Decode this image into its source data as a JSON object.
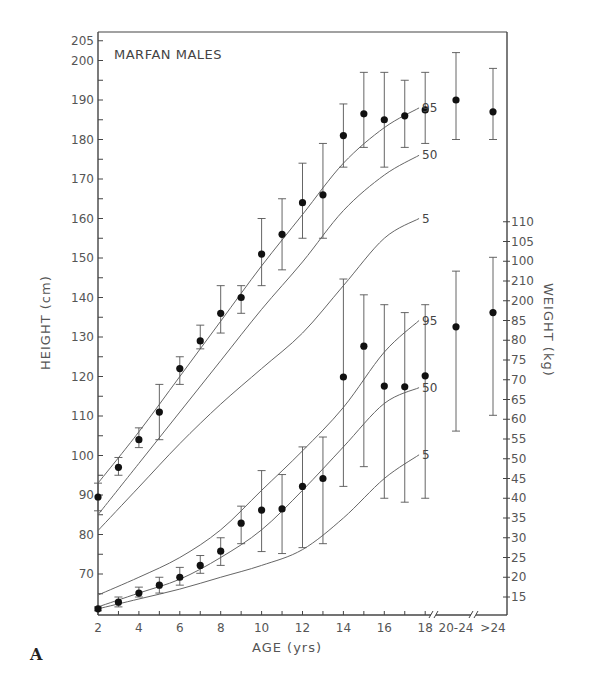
{
  "panel_label": "A",
  "chart_data": {
    "type": "scatter",
    "title": "MARFAN MALES",
    "xlabel": "AGE (yrs)",
    "ylabel_left": "HEIGHT (cm)",
    "ylabel_right": "WEIGHT (kg)",
    "x_tick_labels": [
      "2",
      "4",
      "6",
      "8",
      "10",
      "12",
      "14",
      "16",
      "18",
      "20-24",
      ">24"
    ],
    "categories": [
      "2",
      "3",
      "4",
      "5",
      "6",
      "7",
      "8",
      "9",
      "10",
      "11",
      "12",
      "13",
      "14",
      "15",
      "16",
      "17",
      "18",
      "20-24",
      ">24"
    ],
    "y_left_ticks": [
      205,
      200,
      190,
      180,
      170,
      160,
      150,
      140,
      130,
      120,
      110,
      100,
      90,
      80,
      70
    ],
    "y_left_range": [
      62,
      205
    ],
    "y_right_tick_labels": [
      "110",
      "105",
      "100",
      "210",
      "200",
      "85",
      "80",
      "75",
      "70",
      "65",
      "60",
      "55",
      "50",
      "45",
      "40",
      "35",
      "30",
      "25",
      "20",
      "15"
    ],
    "y_right_range": [
      12,
      110
    ],
    "grid": false,
    "series": [
      {
        "name": "Height (Marfan males)",
        "axis": "left",
        "values": [
          89.5,
          97,
          104,
          111,
          122,
          129,
          136,
          140,
          151,
          156,
          164,
          166,
          181,
          186.5,
          185,
          186,
          187.5,
          190,
          187
        ],
        "error_low": [
          86,
          95,
          102,
          104,
          118,
          127,
          131,
          136,
          143,
          147,
          155,
          155,
          173,
          178,
          173,
          178,
          179,
          180,
          180
        ],
        "error_high": [
          93,
          99.5,
          107,
          118,
          125,
          133,
          143,
          143,
          160,
          165,
          174,
          179,
          189,
          197,
          197,
          195,
          197,
          202,
          198
        ]
      },
      {
        "name": "Weight (Marfan males)",
        "axis": "right",
        "values": [
          12,
          13.7,
          16,
          18,
          20,
          23,
          26.6,
          33.7,
          37,
          37.3,
          43,
          45,
          70.7,
          78.5,
          68.4,
          68.2,
          71,
          83.4,
          87
        ],
        "error_low": [
          11.5,
          12.5,
          15,
          16,
          18,
          21,
          23,
          28.5,
          26.5,
          26,
          27.5,
          28.5,
          43,
          48,
          40,
          39,
          40,
          57,
          61
        ],
        "error_high": [
          12.5,
          15,
          17.5,
          20,
          22.5,
          25.5,
          30,
          38,
          47,
          46,
          53,
          55.5,
          95.5,
          91.5,
          89,
          87,
          89,
          97.5,
          101
        ]
      }
    ],
    "reference_curves": {
      "height": [
        {
          "label": "95",
          "x": [
            2,
            4,
            6,
            8,
            10,
            12,
            14,
            16,
            17.7
          ],
          "y": [
            93,
            106,
            120,
            134,
            148,
            161,
            174,
            183,
            188
          ]
        },
        {
          "label": "50",
          "x": [
            2,
            4,
            6,
            8,
            10,
            12,
            14,
            16,
            17.7
          ],
          "y": [
            85,
            98,
            111,
            124,
            137,
            149,
            162,
            171,
            176
          ]
        },
        {
          "label": "5",
          "x": [
            2,
            4,
            6,
            8,
            10,
            12,
            14,
            16,
            17.7
          ],
          "y": [
            81,
            92,
            103,
            113,
            122,
            131,
            143,
            155,
            160
          ]
        }
      ],
      "weight": [
        {
          "label": "95",
          "x": [
            2,
            4,
            6,
            8,
            10,
            12,
            14,
            16,
            17.7
          ],
          "y": [
            15.5,
            20,
            25,
            32,
            42,
            52,
            63,
            77,
            85
          ]
        },
        {
          "label": "50",
          "x": [
            2,
            4,
            6,
            8,
            10,
            12,
            14,
            16,
            17.7
          ],
          "y": [
            12.5,
            16,
            19.5,
            25,
            32,
            42,
            53,
            64,
            68
          ]
        },
        {
          "label": "5",
          "x": [
            2,
            4,
            6,
            8,
            10,
            12,
            14,
            16,
            17.7
          ],
          "y": [
            12,
            14.5,
            17,
            20,
            23,
            27,
            35,
            45,
            51
          ]
        }
      ]
    }
  }
}
